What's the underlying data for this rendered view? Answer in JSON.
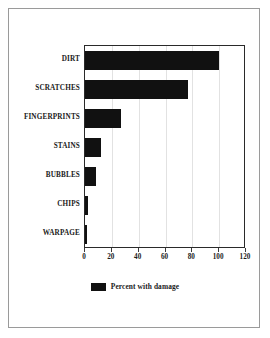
{
  "chart_data": {
    "type": "bar",
    "orientation": "horizontal",
    "title": "",
    "subtitle": "",
    "xlabel": "",
    "ylabel": "",
    "categories": [
      "DIRT",
      "SCRATCHES",
      "FINGERPRINTS",
      "STAINS",
      "BUBBLES",
      "CHIPS",
      "WARPAGE"
    ],
    "values": [
      100,
      77,
      27,
      12,
      8,
      2,
      1.5
    ],
    "series": [
      {
        "name": "Percent with damage",
        "values": [
          100,
          77,
          27,
          12,
          8,
          2,
          1.5
        ]
      }
    ],
    "xlim": [
      0,
      120
    ],
    "xticks": [
      0,
      20,
      40,
      60,
      80,
      100,
      120
    ],
    "xtick_labels": [
      "0",
      "20",
      "40",
      "60",
      "80",
      "100",
      "120"
    ],
    "grid": true,
    "grid_axis": "x",
    "legend": {
      "position": "bottom-center",
      "entries": [
        {
          "label": "Percent with damage",
          "color": "#111111",
          "swatch": "filled-rectangle"
        }
      ]
    },
    "bar_color": "#111111",
    "plot_background": "#ffffff"
  },
  "figure": {
    "border_color": "#9a9a9a",
    "background": "#ffffff"
  }
}
